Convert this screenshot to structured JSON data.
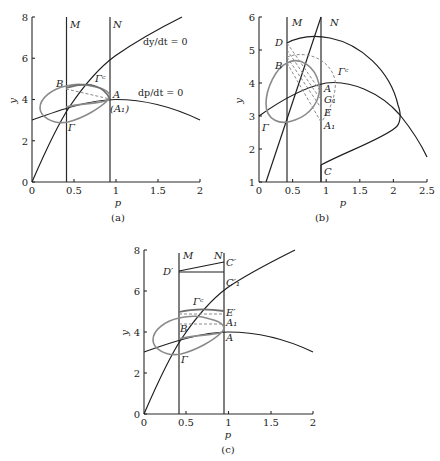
{
  "figure": {
    "panels": [
      {
        "id": "a",
        "caption": "(a)",
        "xlabel": "p",
        "ylabel": "y",
        "xticks": [
          "0",
          "0.5",
          "1",
          "1.5",
          "2"
        ],
        "yticks": [
          "0",
          "2",
          "4",
          "6",
          "8"
        ],
        "labels": {
          "M": "M",
          "N": "N",
          "B": "B",
          "A": "A",
          "A1": "(A₁)",
          "Gamma": "Γ",
          "Gamma_c": "Γᶜ",
          "nullcline_y": "dy/dt = 0",
          "nullcline_p": "dp/dt = 0"
        }
      },
      {
        "id": "b",
        "caption": "(b)",
        "xlabel": "p",
        "ylabel": "y",
        "xticks": [
          "0",
          "0.5",
          "1",
          "1.5",
          "2",
          "2.5"
        ],
        "yticks": [
          "1",
          "2",
          "3",
          "4",
          "5",
          "6"
        ],
        "labels": {
          "M": "M",
          "N": "N",
          "D": "D",
          "B": "B",
          "A": "A",
          "G1": "G₁",
          "E": "E",
          "A1": "A₁",
          "C": "C",
          "Gamma": "Γ",
          "Gamma_c": "Γᶜ"
        }
      },
      {
        "id": "c",
        "caption": "(c)",
        "xlabel": "p",
        "ylabel": "y",
        "xticks": [
          "0",
          "0.5",
          "1",
          "1.5",
          "2"
        ],
        "yticks": [
          "0",
          "2",
          "4",
          "6",
          "8"
        ],
        "labels": {
          "M": "M",
          "N": "N",
          "C_prime": "C′",
          "D_prime": "D′",
          "C1_prime": "C′₁",
          "E_prime": "E′",
          "A1": "A₁",
          "A": "A",
          "B": "B",
          "Gamma": "Γ",
          "Gamma_c": "Γᶜ"
        }
      }
    ]
  }
}
